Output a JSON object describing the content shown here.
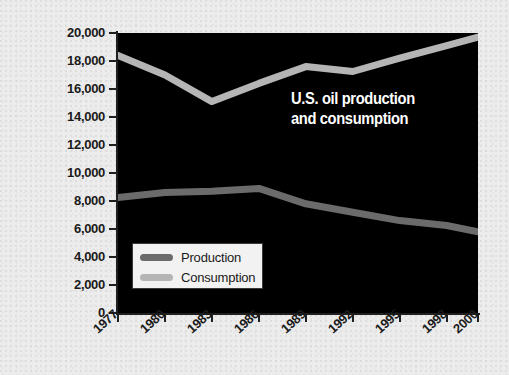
{
  "chart_data": {
    "type": "line",
    "title": "U.S. oil production and consumption",
    "annotation_line1": "U.S. oil production",
    "annotation_line2": "and consumption",
    "xlabel": "",
    "ylabel": "Thousand barrels per day",
    "x": [
      1977,
      1980,
      1983,
      1986,
      1989,
      1992,
      1995,
      1998,
      2000
    ],
    "xtick_labels": [
      "1977",
      "1980",
      "1983",
      "1986",
      "1989",
      "1992",
      "1995",
      "1998",
      "2000"
    ],
    "ytick_labels": [
      "20,000",
      "18,000",
      "16,000",
      "14,000",
      "12,000",
      "10,000",
      "8,000",
      "6,000",
      "4,000",
      "2,000",
      "0"
    ],
    "ytick_values": [
      20000,
      18000,
      16000,
      14000,
      12000,
      10000,
      8000,
      6000,
      4000,
      2000,
      0
    ],
    "ylim": [
      0,
      20000
    ],
    "grid": false,
    "legend_position": "lower-left-inside",
    "series": [
      {
        "name": "Production",
        "color": "#6b6b6b",
        "values": [
          8250,
          8600,
          8700,
          8900,
          7800,
          7200,
          6600,
          6250,
          5800
        ]
      },
      {
        "name": "Consumption",
        "color": "#b5b5b5",
        "values": [
          18400,
          17000,
          15100,
          16400,
          17600,
          17250,
          18200,
          19100,
          19700
        ]
      }
    ],
    "plot_background": "#000000",
    "page_background": "#ececec"
  },
  "legend": {
    "items": [
      {
        "label": "Production",
        "color": "#6b6b6b"
      },
      {
        "label": "Consumption",
        "color": "#b5b5b5"
      }
    ]
  }
}
